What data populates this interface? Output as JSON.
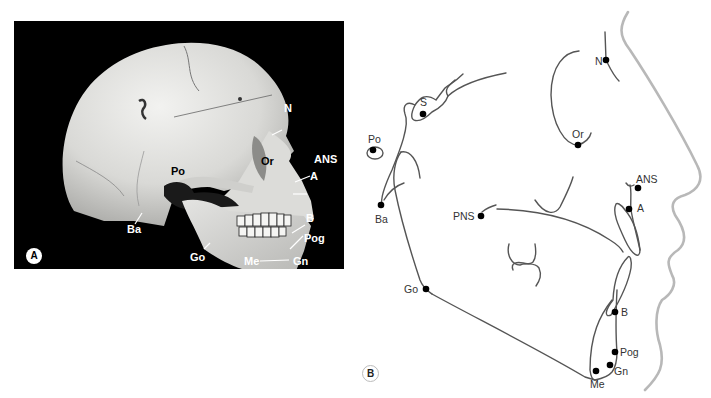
{
  "panels": {
    "a": {
      "badge": "A",
      "description": "Lateral photograph of human skull with cephalometric landmarks",
      "landmarks": [
        {
          "label": "N",
          "x": 270,
          "y": 108
        },
        {
          "label": "Or",
          "x": 247,
          "y": 152
        },
        {
          "label": "ANS",
          "x": 313,
          "y": 154
        },
        {
          "label": "A",
          "x": 309,
          "y": 173
        },
        {
          "label": "Po",
          "x": 171,
          "y": 166
        },
        {
          "label": "Ba",
          "x": 127,
          "y": 224
        },
        {
          "label": "B",
          "x": 305,
          "y": 213
        },
        {
          "label": "Pog",
          "x": 303,
          "y": 234
        },
        {
          "label": "Go",
          "x": 189,
          "y": 252
        },
        {
          "label": "Me",
          "x": 243,
          "y": 257
        },
        {
          "label": "Gn",
          "x": 293,
          "y": 257
        }
      ]
    },
    "b": {
      "badge": "B",
      "description": "Cephalometric tracing with landmarks",
      "landmarks": [
        {
          "label": "S",
          "x": 420,
          "y": 97
        },
        {
          "label": "N",
          "x": 595,
          "y": 58
        },
        {
          "label": "Po",
          "x": 368,
          "y": 137
        },
        {
          "label": "Or",
          "x": 573,
          "y": 130
        },
        {
          "label": "Ba",
          "x": 374,
          "y": 214
        },
        {
          "label": "PNS",
          "x": 453,
          "y": 211
        },
        {
          "label": "ANS",
          "x": 636,
          "y": 177
        },
        {
          "label": "A",
          "x": 637,
          "y": 204
        },
        {
          "label": "Go",
          "x": 404,
          "y": 284
        },
        {
          "label": "B",
          "x": 621,
          "y": 311
        },
        {
          "label": "Pog",
          "x": 621,
          "y": 351
        },
        {
          "label": "Gn",
          "x": 614,
          "y": 370
        },
        {
          "label": "Me",
          "x": 590,
          "y": 379
        }
      ]
    }
  },
  "colors": {
    "photo_bg": "#000000",
    "trace_line": "#555555",
    "soft_tissue": "#b5b5b5",
    "point": "#000000"
  }
}
